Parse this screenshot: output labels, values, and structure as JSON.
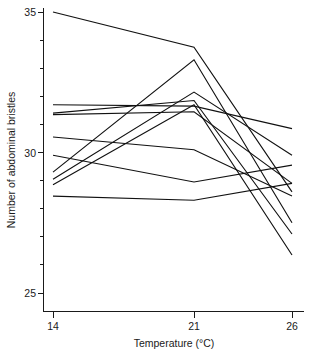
{
  "chart_data": {
    "type": "line",
    "title": "",
    "subtitle": "",
    "xlabel": "Temperature (°C)",
    "ylabel": "Number of abdominal bristles",
    "x": [
      14,
      21,
      26
    ],
    "x_tick_labels": [
      "14",
      "21",
      "26"
    ],
    "y_tick_labels": [
      "25",
      "30",
      "35"
    ],
    "y_ticks_major": [
      25,
      30,
      35
    ],
    "y_minor_tick_step": 1,
    "xlim": [
      12.8,
      27.0
    ],
    "ylim": [
      23.8,
      35.3
    ],
    "grid": false,
    "legend": false,
    "legend_position": "none",
    "annotations": [],
    "series": [
      {
        "name": "line-1",
        "values": [
          35.0,
          33.75,
          28.6
        ]
      },
      {
        "name": "line-2",
        "values": [
          29.3,
          33.3,
          27.5
        ]
      },
      {
        "name": "line-3",
        "values": [
          29.05,
          32.15,
          29.9
        ]
      },
      {
        "name": "line-4",
        "values": [
          31.7,
          31.65,
          30.85
        ]
      },
      {
        "name": "line-5",
        "values": [
          31.4,
          31.85,
          27.1
        ]
      },
      {
        "name": "line-6",
        "values": [
          28.85,
          31.7,
          26.35
        ]
      },
      {
        "name": "line-7",
        "values": [
          31.35,
          31.45,
          28.9
        ]
      },
      {
        "name": "line-8",
        "values": [
          30.55,
          30.1,
          28.45
        ]
      },
      {
        "name": "line-9",
        "values": [
          29.9,
          28.95,
          29.55
        ]
      },
      {
        "name": "line-10",
        "values": [
          28.45,
          28.3,
          28.9
        ]
      }
    ]
  },
  "axis": {
    "x_ticks": [
      "14",
      "21",
      "26"
    ],
    "y_ticks": [
      "35",
      "30",
      "25"
    ],
    "x_title": "Temperature (°C)",
    "y_title": "Number of abdominal bristles"
  }
}
